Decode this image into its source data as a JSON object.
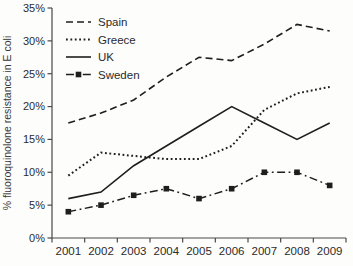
{
  "figure": {
    "background": "#fdfdfc",
    "line_color": "#1e1e1e",
    "axis_color": "#4a4a4a",
    "text_color": "#2b2b2b"
  },
  "chart_data": {
    "type": "line",
    "title": "",
    "xlabel": "",
    "ylabel": "% fluoroquinolone resistance in E coli",
    "x": [
      "2001",
      "2002",
      "2003",
      "2004",
      "2005",
      "2006",
      "2007",
      "2008",
      "2009"
    ],
    "ylim": [
      0,
      35
    ],
    "ytick_step": 5,
    "ytick_labels": [
      "0%",
      "5%",
      "10%",
      "15%",
      "20%",
      "25%",
      "30%",
      "35%"
    ],
    "grid": false,
    "legend_position": "top-left-inside",
    "series": [
      {
        "name": "Spain",
        "style": "dashed",
        "marker": "none",
        "values": [
          17.5,
          19,
          21,
          24.5,
          27.5,
          27,
          29.5,
          32.5,
          31.5
        ]
      },
      {
        "name": "Greece",
        "style": "dotted",
        "marker": "none",
        "values": [
          9.5,
          13,
          12.5,
          12,
          12,
          14,
          19.5,
          22,
          23
        ]
      },
      {
        "name": "UK",
        "style": "solid",
        "marker": "none",
        "values": [
          6,
          7,
          11,
          14,
          17,
          20,
          17.5,
          15,
          17.5
        ]
      },
      {
        "name": "Sweden",
        "style": "dashdot",
        "marker": "square",
        "values": [
          4,
          5,
          6.5,
          7.5,
          6,
          7.5,
          10,
          10,
          8
        ]
      }
    ]
  }
}
